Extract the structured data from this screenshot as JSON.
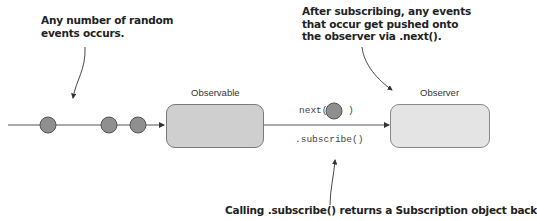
{
  "annotations": {
    "random_events": "Any number of random\nevents occurs.",
    "after_subscribing": "After subscribing, any events\nthat occur get pushed onto\nthe observer via .next().",
    "subscribe_returns": "Calling .subscribe() returns a Subscription object back"
  },
  "nodes": {
    "observable": {
      "label": "Observable"
    },
    "observer": {
      "label": "Observer"
    }
  },
  "edge": {
    "next_label_prefix": "next(",
    "next_label_suffix": ")",
    "subscribe_label": ".subscribe()"
  },
  "colors": {
    "event_marble": "#8f8f8f",
    "observable_fill": "#cfcfcf",
    "observer_fill": "#e4e4e4",
    "line": "#555555"
  }
}
